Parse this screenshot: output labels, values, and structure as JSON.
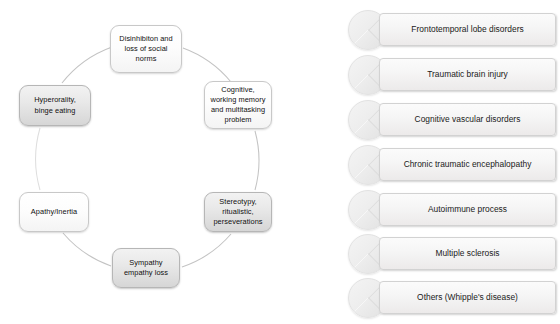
{
  "diagram": {
    "type": "cycle",
    "nodes": [
      {
        "id": "disinhibition",
        "label": "Disinhibiton and loss of social norms",
        "position": "top",
        "shaded": false
      },
      {
        "id": "cognitive",
        "label": "Cognitive, working memory and multitasking problem",
        "position": "upper-right",
        "shaded": false
      },
      {
        "id": "stereotypy",
        "label": "Stereotypy, ritualistic, perseverations",
        "position": "lower-right",
        "shaded": true
      },
      {
        "id": "sympathy",
        "label": "Sympathy empathy loss",
        "position": "bottom",
        "shaded": true
      },
      {
        "id": "apathy",
        "label": "Apathy/Inertia",
        "position": "lower-left",
        "shaded": false
      },
      {
        "id": "hyperorality",
        "label": "Hyperorality, binge eating",
        "position": "upper-left",
        "shaded": true
      }
    ]
  },
  "disorder_list": {
    "items": [
      {
        "label": "Frontotemporal lobe disorders"
      },
      {
        "label": "Traumatic brain injury"
      },
      {
        "label": "Cognitive vascular disorders"
      },
      {
        "label": "Chronic traumatic encephalopathy"
      },
      {
        "label": "Autoimmune process"
      },
      {
        "label": "Multiple sclerosis"
      },
      {
        "label": "Others (Whipple's disease)"
      }
    ]
  },
  "colors": {
    "background": "#ffffff",
    "node_border": "#c8c8c8",
    "node_fill_light": "#fdfdfd",
    "node_fill_shaded": "#e0e0e0",
    "arc_stroke": "#bfbfbf",
    "text": "#101010",
    "pill_fill": "#f6f6f6",
    "pill_border": "#d2d2d2",
    "circle_fill": "#ededed"
  }
}
